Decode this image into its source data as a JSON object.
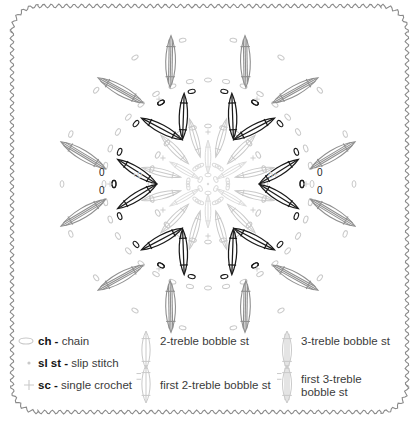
{
  "page": {
    "width": 419,
    "height": 430,
    "background": "#ffffff",
    "border_style": "wavy-scalloped-rounded-rectangle",
    "border_color": "#8a8a8a"
  },
  "colors": {
    "dark_stitch": "#1a1a1a",
    "mid_gray": "#8f8f8f",
    "light_gray": "#c9c9c9",
    "very_light_gray": "#dcdcdc",
    "text": "#3b3b3b",
    "text_bold": "#141414",
    "border": "#8a8a8a"
  },
  "diagram": {
    "name": "crochet-mandala-chart",
    "center": {
      "x": 208,
      "y": 184
    },
    "symmetry": 6,
    "rings": [
      {
        "name": "center-rosette",
        "radius": 22,
        "element": "chain-ring-and-petals",
        "color": "#dcdcdc",
        "count": 6
      },
      {
        "name": "inner-petal-ring",
        "radius": 40,
        "element": "first-2-treble-bobble-st",
        "color": "#c9c9c9",
        "count": 6
      },
      {
        "name": "mid-chain-ring",
        "radius": 58,
        "element": "ch",
        "color": "#c9c9c9",
        "count": 24
      },
      {
        "name": "inner-bobble-ring",
        "radius": 66,
        "element": "2-treble-bobble-st",
        "color": "#1a1a1a",
        "count": 12
      },
      {
        "name": "outer-chain-ring",
        "radius": 98,
        "element": "ch",
        "color": "#c9c9c9",
        "count": 36
      },
      {
        "name": "outer-bobble-ring",
        "radius": 118,
        "element": "3-treble-bobble-st",
        "color": "#9a9a9a",
        "count": 12
      }
    ],
    "marks": [
      {
        "label": "+0",
        "x": 132,
        "y": 178
      },
      {
        "label": "0+",
        "x": 268,
        "y": 178
      },
      {
        "label": "0",
        "x": 99,
        "y": 176
      },
      {
        "label": "0",
        "x": 99,
        "y": 194
      },
      {
        "label": "0",
        "x": 317,
        "y": 176
      },
      {
        "label": "0",
        "x": 317,
        "y": 194
      }
    ]
  },
  "legend": {
    "name": "stitch-legend",
    "rows": [
      {
        "items": [
          {
            "id": "ch",
            "icon": "chain-oval-icon",
            "abbr": "ch",
            "sep": "-",
            "label": "chain"
          },
          {
            "id": "bob2",
            "icon": "2-treble-bobble-icon",
            "abbr": "",
            "sep": "",
            "label": "2-treble bobble st"
          },
          {
            "id": "bob3",
            "icon": "3-treble-bobble-icon",
            "abbr": "",
            "sep": "",
            "label": "3-treble bobble st"
          }
        ]
      },
      {
        "items": [
          {
            "id": "slst",
            "icon": "slip-stitch-dot-icon",
            "abbr": "sl st",
            "sep": "-",
            "label": "slip stitch"
          }
        ]
      },
      {
        "items": [
          {
            "id": "sc",
            "icon": "single-crochet-cross-icon",
            "abbr": "sc",
            "sep": "-",
            "label": "single crochet"
          },
          {
            "id": "fbob2",
            "icon": "first-2-treble-bobble-icon",
            "abbr": "",
            "sep": "",
            "label": "first 2-treble bobble st"
          },
          {
            "id": "fbob3",
            "icon": "first-3-treble-bobble-icon",
            "abbr": "",
            "sep": "",
            "label": "first 3-treble\nbobble st"
          }
        ]
      }
    ],
    "entries": [
      {
        "abbr": "ch",
        "label": "chain"
      },
      {
        "abbr": "sl st",
        "label": "slip stitch"
      },
      {
        "abbr": "sc",
        "label": "single crochet"
      },
      {
        "abbr": "",
        "label": "2-treble bobble st"
      },
      {
        "abbr": "",
        "label": "first 2-treble bobble st"
      },
      {
        "abbr": "",
        "label": "3-treble bobble st"
      },
      {
        "abbr": "",
        "label": "first 3-treble bobble st"
      }
    ],
    "line1": "first 3-treble",
    "line2": "bobble st"
  }
}
